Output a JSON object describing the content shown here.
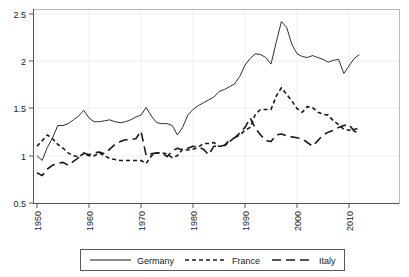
{
  "chart_data": {
    "type": "line",
    "title": "",
    "subtitle": "",
    "xlabel": "",
    "ylabel": "",
    "xlim": [
      1950,
      2012
    ],
    "ylim": [
      0.5,
      2.55
    ],
    "grid": true,
    "legend_position": "bottom",
    "xticks": [
      1950,
      1960,
      1970,
      1980,
      1990,
      2000,
      2010
    ],
    "xtick_labels": [
      "1950",
      "1960",
      "1970",
      "1980",
      "1990",
      "2000",
      "2010"
    ],
    "yticks": [
      0.5,
      1,
      1.5,
      2,
      2.5
    ],
    "ytick_labels": [
      "0.5",
      "1",
      "1.5",
      "2",
      "2.5"
    ],
    "x": [
      1950,
      1951,
      1952,
      1953,
      1954,
      1955,
      1956,
      1957,
      1958,
      1959,
      1960,
      1961,
      1962,
      1963,
      1964,
      1965,
      1966,
      1967,
      1968,
      1969,
      1970,
      1971,
      1972,
      1973,
      1974,
      1975,
      1976,
      1977,
      1978,
      1979,
      1980,
      1981,
      1982,
      1983,
      1984,
      1985,
      1986,
      1987,
      1988,
      1989,
      1990,
      1991,
      1992,
      1993,
      1994,
      1995,
      1996,
      1997,
      1998,
      1999,
      2000,
      2001,
      2002,
      2003,
      2004,
      2005,
      2006,
      2007,
      2008,
      2009,
      2010,
      2011,
      2012
    ],
    "series": [
      {
        "name": "Germany",
        "style": "solid",
        "color": "#1a1a1a",
        "values": [
          1.0,
          0.95,
          1.09,
          1.19,
          1.32,
          1.32,
          1.34,
          1.38,
          1.42,
          1.48,
          1.4,
          1.36,
          1.36,
          1.37,
          1.38,
          1.36,
          1.35,
          1.36,
          1.38,
          1.41,
          1.43,
          1.51,
          1.42,
          1.35,
          1.34,
          1.34,
          1.32,
          1.22,
          1.3,
          1.43,
          1.49,
          1.53,
          1.56,
          1.59,
          1.62,
          1.68,
          1.7,
          1.73,
          1.76,
          1.84,
          1.96,
          2.03,
          2.08,
          2.07,
          2.04,
          1.97,
          2.2,
          2.42,
          2.36,
          2.18,
          2.08,
          2.05,
          2.04,
          2.06,
          2.04,
          2.02,
          1.99,
          2.01,
          2.02,
          1.87,
          1.95,
          2.03,
          2.07
        ]
      },
      {
        "name": "France",
        "style": "dashed-short",
        "color": "#1a1a1a",
        "values": [
          1.1,
          1.16,
          1.22,
          1.18,
          1.12,
          1.08,
          1.03,
          1.0,
          0.99,
          1.02,
          1.0,
          1.0,
          1.03,
          1.0,
          0.97,
          0.96,
          0.95,
          0.95,
          0.95,
          0.95,
          0.95,
          0.92,
          1.0,
          1.03,
          1.03,
          1.02,
          0.98,
          1.0,
          1.07,
          1.06,
          1.07,
          1.09,
          1.13,
          1.13,
          1.14,
          1.1,
          1.1,
          1.15,
          1.19,
          1.22,
          1.27,
          1.3,
          1.44,
          1.49,
          1.49,
          1.49,
          1.63,
          1.72,
          1.65,
          1.58,
          1.5,
          1.46,
          1.52,
          1.51,
          1.46,
          1.44,
          1.43,
          1.37,
          1.33,
          1.28,
          1.27,
          1.28,
          1.29
        ]
      },
      {
        "name": "Italy",
        "style": "dashed-long",
        "color": "#1a1a1a",
        "values": [
          0.82,
          0.79,
          0.86,
          0.9,
          0.92,
          0.93,
          0.9,
          0.94,
          0.98,
          1.03,
          1.01,
          1.03,
          1.04,
          1.02,
          1.07,
          1.12,
          1.15,
          1.17,
          1.17,
          1.18,
          1.26,
          1.0,
          1.02,
          1.03,
          1.03,
          0.99,
          1.05,
          1.08,
          1.06,
          1.08,
          1.1,
          1.09,
          1.07,
          1.01,
          1.1,
          1.1,
          1.11,
          1.16,
          1.19,
          1.24,
          1.3,
          1.4,
          1.29,
          1.22,
          1.16,
          1.15,
          1.22,
          1.23,
          1.21,
          1.2,
          1.19,
          1.18,
          1.14,
          1.1,
          1.16,
          1.22,
          1.25,
          1.27,
          1.3,
          1.32,
          1.33,
          1.26,
          1.24
        ]
      }
    ]
  },
  "legend": {
    "entries": [
      {
        "label": "Germany",
        "style": "solid"
      },
      {
        "label": "France",
        "style": "dashed-short"
      },
      {
        "label": "Italy",
        "style": "dashed-long"
      }
    ]
  }
}
